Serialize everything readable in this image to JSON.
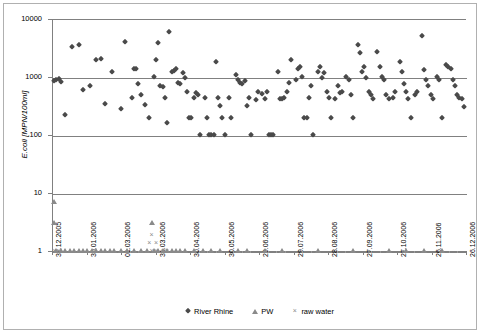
{
  "chart_data": {
    "type": "scatter",
    "title": "",
    "xlabel": "",
    "ylabel": "E.coli [MPN/100ml]",
    "yscale": "log",
    "ylim": [
      1,
      10000
    ],
    "ytick_labels": [
      "10000",
      "1000",
      "100",
      "10",
      "1"
    ],
    "ytick_values": [
      10000,
      1000,
      100,
      10,
      1
    ],
    "grid": true,
    "legend_position": "bottom",
    "xtick_labels": [
      "31.12.2005",
      "30.01.2006",
      "01.03.2006",
      "31.03.2006",
      "30.04.2006",
      "30.05.2006",
      "29.06.2006",
      "29.07.2006",
      "28.08.2006",
      "27.09.2006",
      "27.10.2006",
      "26.11.2006",
      "26.12.2006"
    ],
    "xlim_labels": [
      "31.12.2005",
      "26.12.2006"
    ],
    "series": [
      {
        "name": "River Rhine",
        "marker": "diamond",
        "color": "#4a4a4a",
        "points": [
          [
            1,
            870
          ],
          [
            2,
            900
          ],
          [
            3,
            930
          ],
          [
            4,
            820
          ],
          [
            6,
            220
          ],
          [
            9,
            3300
          ],
          [
            12,
            3500
          ],
          [
            14,
            600
          ],
          [
            17,
            690
          ],
          [
            20,
            1950
          ],
          [
            22,
            2050
          ],
          [
            24,
            340
          ],
          [
            27,
            1200
          ],
          [
            31,
            280
          ],
          [
            33,
            4000
          ],
          [
            36,
            430
          ],
          [
            37,
            1400
          ],
          [
            38,
            1350
          ],
          [
            39,
            760
          ],
          [
            40,
            480
          ],
          [
            42,
            330
          ],
          [
            44,
            200
          ],
          [
            46,
            1000
          ],
          [
            47,
            2000
          ],
          [
            48,
            3800
          ],
          [
            49,
            700
          ],
          [
            50,
            680
          ],
          [
            51,
            430
          ],
          [
            52,
            160
          ],
          [
            53,
            5900
          ],
          [
            54,
            1200
          ],
          [
            55,
            1250
          ],
          [
            56,
            1350
          ],
          [
            57,
            800
          ],
          [
            58,
            760
          ],
          [
            59,
            1150
          ],
          [
            60,
            950
          ],
          [
            61,
            560
          ],
          [
            62,
            200
          ],
          [
            63,
            200
          ],
          [
            64,
            440
          ],
          [
            65,
            540
          ],
          [
            66,
            480
          ],
          [
            67,
            100
          ],
          [
            69,
            430
          ],
          [
            70,
            200
          ],
          [
            71,
            100
          ],
          [
            72,
            100
          ],
          [
            73,
            100
          ],
          [
            74,
            1800
          ],
          [
            75,
            430
          ],
          [
            76,
            320
          ],
          [
            77,
            200
          ],
          [
            78,
            100
          ],
          [
            80,
            440
          ],
          [
            81,
            200
          ],
          [
            83,
            1100
          ],
          [
            84,
            900
          ],
          [
            85,
            800
          ],
          [
            86,
            760
          ],
          [
            87,
            860
          ],
          [
            88,
            320
          ],
          [
            89,
            430
          ],
          [
            90,
            100
          ],
          [
            92,
            400
          ],
          [
            93,
            560
          ],
          [
            95,
            500
          ],
          [
            96,
            420
          ],
          [
            97,
            560
          ],
          [
            98,
            100
          ],
          [
            99,
            100
          ],
          [
            100,
            100
          ],
          [
            102,
            1200
          ],
          [
            103,
            420
          ],
          [
            104,
            420
          ],
          [
            105,
            430
          ],
          [
            106,
            560
          ],
          [
            107,
            780
          ],
          [
            108,
            2000
          ],
          [
            110,
            900
          ],
          [
            111,
            1400
          ],
          [
            112,
            1500
          ],
          [
            113,
            1000
          ],
          [
            114,
            200
          ],
          [
            115,
            200
          ],
          [
            116,
            430
          ],
          [
            117,
            700
          ],
          [
            118,
            100
          ],
          [
            120,
            1200
          ],
          [
            121,
            1500
          ],
          [
            122,
            950
          ],
          [
            123,
            1150
          ],
          [
            124,
            560
          ],
          [
            125,
            430
          ],
          [
            126,
            200
          ],
          [
            128,
            420
          ],
          [
            129,
            700
          ],
          [
            130,
            540
          ],
          [
            131,
            560
          ],
          [
            133,
            1000
          ],
          [
            134,
            900
          ],
          [
            135,
            480
          ],
          [
            136,
            200
          ],
          [
            138,
            3500
          ],
          [
            139,
            2600
          ],
          [
            140,
            1200
          ],
          [
            141,
            1500
          ],
          [
            142,
            950
          ],
          [
            143,
            560
          ],
          [
            144,
            480
          ],
          [
            145,
            420
          ],
          [
            147,
            2700
          ],
          [
            148,
            1500
          ],
          [
            149,
            1000
          ],
          [
            150,
            900
          ],
          [
            151,
            480
          ],
          [
            152,
            420
          ],
          [
            154,
            430
          ],
          [
            155,
            560
          ],
          [
            157,
            1800
          ],
          [
            158,
            1200
          ],
          [
            159,
            760
          ],
          [
            160,
            560
          ],
          [
            161,
            420
          ],
          [
            162,
            200
          ],
          [
            164,
            480
          ],
          [
            165,
            560
          ],
          [
            167,
            5000
          ],
          [
            168,
            1300
          ],
          [
            169,
            900
          ],
          [
            170,
            700
          ],
          [
            171,
            480
          ],
          [
            172,
            420
          ],
          [
            174,
            1000
          ],
          [
            175,
            900
          ],
          [
            176,
            200
          ],
          [
            178,
            1600
          ],
          [
            179,
            1500
          ],
          [
            180,
            1400
          ],
          [
            181,
            900
          ],
          [
            182,
            700
          ],
          [
            183,
            480
          ],
          [
            184,
            430
          ],
          [
            185,
            420
          ],
          [
            186,
            300
          ]
        ]
      },
      {
        "name": "PW",
        "marker": "triangle",
        "color": "#8a8a8a",
        "points": [
          [
            1,
            7
          ],
          [
            1,
            3
          ],
          [
            2,
            1
          ],
          [
            4,
            1
          ],
          [
            6,
            1
          ],
          [
            8,
            1
          ],
          [
            10,
            1
          ],
          [
            12,
            1
          ],
          [
            14,
            1
          ],
          [
            16,
            1
          ],
          [
            18,
            1
          ],
          [
            20,
            1
          ],
          [
            22,
            1
          ],
          [
            24,
            1
          ],
          [
            26,
            1
          ],
          [
            28,
            1
          ],
          [
            31,
            1
          ],
          [
            34,
            1
          ],
          [
            37,
            1
          ],
          [
            40,
            1
          ],
          [
            43,
            1
          ],
          [
            45,
            3
          ],
          [
            46,
            1
          ],
          [
            48,
            1
          ],
          [
            50,
            1
          ],
          [
            52,
            1
          ],
          [
            54,
            1
          ],
          [
            56,
            1
          ],
          [
            58,
            1
          ],
          [
            60,
            1
          ],
          [
            64,
            1
          ],
          [
            68,
            1
          ],
          [
            72,
            1
          ],
          [
            76,
            1
          ],
          [
            84,
            1
          ],
          [
            88,
            1
          ],
          [
            96,
            1
          ],
          [
            104,
            1
          ],
          [
            120,
            1
          ],
          [
            136,
            1
          ],
          [
            152,
            1
          ],
          [
            160,
            1
          ],
          [
            168,
            1
          ],
          [
            176,
            1
          ]
        ]
      },
      {
        "name": "raw water",
        "marker": "cross",
        "color": "#8a8a8a",
        "points": [
          [
            1,
            1
          ],
          [
            2,
            1
          ],
          [
            3,
            1
          ],
          [
            45,
            1.9
          ],
          [
            44,
            1.4
          ],
          [
            47,
            1.4
          ],
          [
            45,
            1
          ],
          [
            47,
            1
          ],
          [
            50,
            1
          ],
          [
            52,
            1
          ]
        ]
      }
    ]
  },
  "legend": {
    "items": [
      {
        "label": "River Rhine",
        "marker": "diamond-icon"
      },
      {
        "label": "PW",
        "marker": "triangle-icon"
      },
      {
        "label": "raw water",
        "marker": "cross-icon"
      }
    ]
  }
}
